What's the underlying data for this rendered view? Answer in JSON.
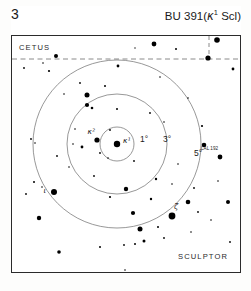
{
  "header": {
    "page_number": "3",
    "title_main": "BU 391",
    "title_paren_open": "(",
    "title_star": "κ",
    "title_superscript": "1",
    "title_constellation": " Scl",
    "title_paren_close": ")",
    "title_full": "BU 391 (κ¹ Scl)"
  },
  "constellations": {
    "upper": "CETUS",
    "lower": "SCULPTOR"
  },
  "bottom_caption": "",
  "colors": {
    "frame": "#2b2b2b",
    "star": "#000000",
    "circle": "#6b6b6b",
    "boundary": "#8a8a8a",
    "background": "#ffffff",
    "text": "#1a1a1a"
  },
  "chart_data": {
    "type": "scatter",
    "xlabel": "",
    "ylabel": "",
    "grid": false,
    "legend": false,
    "projection": "finder-chart",
    "field_width_px": 228,
    "field_height_px": 236,
    "center": {
      "x": 105,
      "y": 108,
      "label": "κ¹"
    },
    "radius_circles": [
      {
        "label": "1°",
        "r": 17,
        "label_x": 128,
        "label_y": 106
      },
      {
        "label": "3°",
        "r": 50,
        "label_x": 151,
        "label_y": 106
      },
      {
        "label": "5°",
        "r": 84,
        "label_x": 182,
        "label_y": 120
      }
    ],
    "boundaries": [
      {
        "type": "horizontal-dashed",
        "y": 23,
        "x1": 0,
        "x2": 228
      },
      {
        "type": "vertical-dashed",
        "x": 197,
        "y1": 0,
        "y2": 23
      }
    ],
    "named_stars": [
      {
        "name": "κ¹",
        "x": 105,
        "y": 108,
        "mag_px": 3.2,
        "label_dx": 6,
        "label_dy": -1
      },
      {
        "name": "κ²",
        "x": 85,
        "y": 104,
        "mag_px": 2.6,
        "label_dx": -2,
        "label_dy": -6
      },
      {
        "name": "ι",
        "x": 42,
        "y": 156,
        "mag_px": 3.0,
        "label_dx": -8,
        "label_dy": 1
      },
      {
        "name": "ζ",
        "x": 160,
        "y": 180,
        "mag_px": 3.4,
        "label_dx": 2,
        "label_dy": -7
      },
      {
        "name": "LAL 192",
        "x": 208,
        "y": 121,
        "mag_px": 2.4,
        "label_dx": -2,
        "label_dy": -7
      }
    ],
    "field_stars": [
      {
        "x": 12,
        "y": 32,
        "r": 0.9
      },
      {
        "x": 31,
        "y": 27,
        "r": 0.8
      },
      {
        "x": 44,
        "y": 20,
        "r": 2.0
      },
      {
        "x": 37,
        "y": 35,
        "r": 1.1
      },
      {
        "x": 68,
        "y": 47,
        "r": 0.9
      },
      {
        "x": 106,
        "y": 30,
        "r": 1.4
      },
      {
        "x": 93,
        "y": 50,
        "r": 1.0
      },
      {
        "x": 75,
        "y": 59,
        "r": 2.5
      },
      {
        "x": 75,
        "y": 69,
        "r": 2.1
      },
      {
        "x": 80,
        "y": 72,
        "r": 1.3
      },
      {
        "x": 123,
        "y": 12,
        "r": 0.7
      },
      {
        "x": 142,
        "y": 8,
        "r": 2.4
      },
      {
        "x": 164,
        "y": 13,
        "r": 1.0
      },
      {
        "x": 196,
        "y": 22,
        "r": 2.6
      },
      {
        "x": 205,
        "y": 4,
        "r": 2.8
      },
      {
        "x": 221,
        "y": 33,
        "r": 1.4
      },
      {
        "x": 148,
        "y": 41,
        "r": 0.8
      },
      {
        "x": 176,
        "y": 62,
        "r": 0.8
      },
      {
        "x": 190,
        "y": 90,
        "r": 1.1
      },
      {
        "x": 192,
        "y": 109,
        "r": 2.3
      },
      {
        "x": 166,
        "y": 128,
        "r": 0.8
      },
      {
        "x": 152,
        "y": 86,
        "r": 0.8
      },
      {
        "x": 138,
        "y": 77,
        "r": 0.9
      },
      {
        "x": 105,
        "y": 73,
        "r": 1.0
      },
      {
        "x": 98,
        "y": 94,
        "r": 0.9
      },
      {
        "x": 70,
        "y": 111,
        "r": 1.4
      },
      {
        "x": 61,
        "y": 108,
        "r": 0.8
      },
      {
        "x": 45,
        "y": 120,
        "r": 0.9
      },
      {
        "x": 22,
        "y": 146,
        "r": 1.0
      },
      {
        "x": 30,
        "y": 151,
        "r": 0.8
      },
      {
        "x": 14,
        "y": 158,
        "r": 0.9
      },
      {
        "x": 19,
        "y": 103,
        "r": 0.9
      },
      {
        "x": 23,
        "y": 107,
        "r": 0.8
      },
      {
        "x": 27,
        "y": 182,
        "r": 2.2
      },
      {
        "x": 57,
        "y": 131,
        "r": 0.8
      },
      {
        "x": 82,
        "y": 140,
        "r": 0.9
      },
      {
        "x": 98,
        "y": 161,
        "r": 1.1
      },
      {
        "x": 114,
        "y": 153,
        "r": 2.2
      },
      {
        "x": 121,
        "y": 177,
        "r": 2.1
      },
      {
        "x": 128,
        "y": 193,
        "r": 2.5
      },
      {
        "x": 132,
        "y": 205,
        "r": 1.5
      },
      {
        "x": 123,
        "y": 208,
        "r": 1.0
      },
      {
        "x": 112,
        "y": 209,
        "r": 0.9
      },
      {
        "x": 139,
        "y": 163,
        "r": 1.2
      },
      {
        "x": 146,
        "y": 191,
        "r": 1.0
      },
      {
        "x": 152,
        "y": 202,
        "r": 0.9
      },
      {
        "x": 176,
        "y": 166,
        "r": 2.3
      },
      {
        "x": 186,
        "y": 176,
        "r": 0.9
      },
      {
        "x": 199,
        "y": 184,
        "r": 0.8
      },
      {
        "x": 216,
        "y": 166,
        "r": 2.0
      },
      {
        "x": 206,
        "y": 145,
        "r": 0.8
      },
      {
        "x": 218,
        "y": 206,
        "r": 0.9
      },
      {
        "x": 144,
        "y": 143,
        "r": 1.2
      },
      {
        "x": 160,
        "y": 148,
        "r": 0.8
      },
      {
        "x": 182,
        "y": 152,
        "r": 0.9
      },
      {
        "x": 122,
        "y": 125,
        "r": 0.9
      },
      {
        "x": 47,
        "y": 216,
        "r": 1.8
      },
      {
        "x": 88,
        "y": 211,
        "r": 1.0
      },
      {
        "x": 113,
        "y": 234,
        "r": 0.8
      },
      {
        "x": 168,
        "y": 243,
        "r": 1.1
      },
      {
        "x": 152,
        "y": 250,
        "r": 0.9
      },
      {
        "x": 179,
        "y": 196,
        "r": 0.8
      },
      {
        "x": 63,
        "y": 93,
        "r": 0.8
      },
      {
        "x": 52,
        "y": 58,
        "r": 0.8
      },
      {
        "x": 96,
        "y": 122,
        "r": 0.8
      },
      {
        "x": 88,
        "y": 117,
        "r": 0.9
      }
    ]
  }
}
